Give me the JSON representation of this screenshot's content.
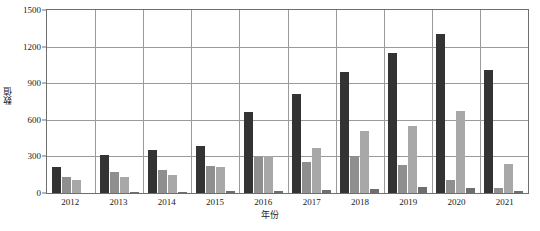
{
  "chart_data": {
    "type": "bar",
    "title": "",
    "subtitle": "",
    "xlabel": "年份",
    "ylabel": "数值",
    "categories": [
      "2012",
      "2013",
      "2014",
      "2015",
      "2016",
      "2017",
      "2018",
      "2019",
      "2020",
      "2021"
    ],
    "ylim": [
      0,
      1500
    ],
    "yticks": [
      0,
      300,
      600,
      900,
      1200,
      1500
    ],
    "ytick_labels": [
      "0",
      "300",
      "600",
      "900",
      "1200",
      "1500"
    ],
    "grid": "horizontal-and-vertical",
    "legend": "none",
    "series": [
      {
        "name": "series-1",
        "color": "#333333",
        "values": [
          215,
          310,
          350,
          385,
          660,
          810,
          990,
          1150,
          1300,
          1010
        ]
      },
      {
        "name": "series-2",
        "color": "#8f8f8f",
        "values": [
          135,
          175,
          190,
          225,
          295,
          255,
          300,
          230,
          110,
          45
        ]
      },
      {
        "name": "series-3",
        "color": "#a8a8a8",
        "values": [
          105,
          130,
          150,
          210,
          300,
          370,
          510,
          550,
          670,
          240
        ]
      },
      {
        "name": "series-4",
        "color": "#6e6e6e",
        "values": [
          0,
          10,
          12,
          15,
          18,
          25,
          30,
          50,
          40,
          20
        ]
      }
    ]
  },
  "axis": {
    "y_title": "数值",
    "x_title": "年份"
  }
}
